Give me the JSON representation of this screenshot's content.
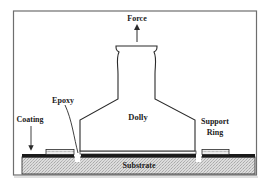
{
  "diagram": {
    "labels": {
      "force": "Force",
      "epoxy": "Epoxy",
      "coating": "Coating",
      "dolly": "Dolly",
      "support_ring_line1": "Support",
      "support_ring_line2": "Ring",
      "substrate": "Substrate"
    },
    "colors": {
      "frame": "#6e6e6e",
      "outline": "#2a2a2a",
      "coating": "#1a1a1a",
      "substrate_fill": "#d4d4d4",
      "ring_fill": "#ececec",
      "text": "#222222"
    }
  }
}
